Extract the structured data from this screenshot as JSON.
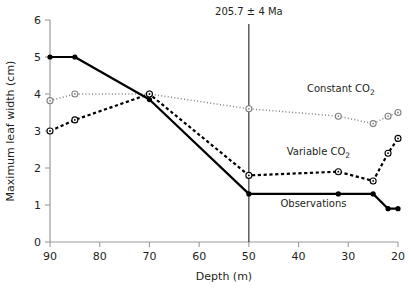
{
  "chart_data": {
    "type": "line",
    "title": "",
    "xlabel": "Depth (m)",
    "ylabel": "Maximum leaf width (cm)",
    "xlim": [
      90,
      20
    ],
    "ylim": [
      0,
      6
    ],
    "x_ticks": [
      90,
      80,
      70,
      60,
      50,
      40,
      30,
      20
    ],
    "y_ticks": [
      0,
      1,
      2,
      3,
      4,
      5,
      6
    ],
    "x_axis_reversed": true,
    "grid": false,
    "legend_position": "inline-annotations",
    "annotations": [
      {
        "name": "age-marker",
        "text": "205.7 ± 4 Ma",
        "x": 50,
        "type": "vertical-line"
      }
    ],
    "series": [
      {
        "name": "Constant CO2",
        "label": "Constant CO",
        "label_sub": "2",
        "style": "dotted",
        "color": "#808080",
        "marker": "open-circle",
        "label_x": 31.5,
        "label_y": 4.05,
        "points": [
          {
            "x": 90,
            "y": 3.82
          },
          {
            "x": 85,
            "y": 4.0
          },
          {
            "x": 70,
            "y": 4.0
          },
          {
            "x": 50,
            "y": 3.6
          },
          {
            "x": 32,
            "y": 3.4
          },
          {
            "x": 25,
            "y": 3.2
          },
          {
            "x": 22,
            "y": 3.4
          },
          {
            "x": 20,
            "y": 3.5
          }
        ]
      },
      {
        "name": "Variable CO2",
        "label": "Variable CO",
        "label_sub": "2",
        "style": "dashed",
        "color": "#000000",
        "marker": "open-circle",
        "label_x": 36,
        "label_y": 2.35,
        "points": [
          {
            "x": 90,
            "y": 3.0
          },
          {
            "x": 85,
            "y": 3.3
          },
          {
            "x": 70,
            "y": 4.0
          },
          {
            "x": 50,
            "y": 1.8
          },
          {
            "x": 32,
            "y": 1.9
          },
          {
            "x": 25,
            "y": 1.65
          },
          {
            "x": 22,
            "y": 2.4
          },
          {
            "x": 20,
            "y": 2.8
          }
        ]
      },
      {
        "name": "Observations",
        "label": "Observations",
        "label_sub": "",
        "style": "solid",
        "color": "#000000",
        "marker": "filled-circle",
        "label_x": 37,
        "label_y": 0.95,
        "points": [
          {
            "x": 90,
            "y": 5.0
          },
          {
            "x": 85,
            "y": 5.0
          },
          {
            "x": 70,
            "y": 3.85
          },
          {
            "x": 50,
            "y": 1.3
          },
          {
            "x": 32,
            "y": 1.3
          },
          {
            "x": 25,
            "y": 1.3
          },
          {
            "x": 22,
            "y": 0.9
          },
          {
            "x": 20,
            "y": 0.9
          }
        ]
      }
    ]
  }
}
